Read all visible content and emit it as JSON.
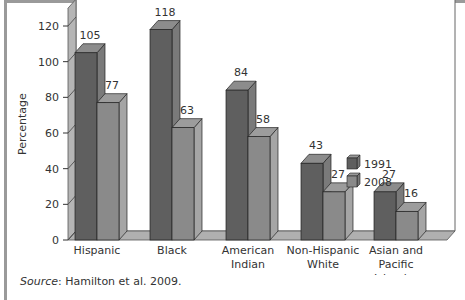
{
  "chart_data": {
    "type": "bar",
    "style": "3d-clustered",
    "title": "",
    "xlabel": "",
    "ylabel": "Percentage",
    "ylim": [
      0,
      130
    ],
    "yticks": [
      0,
      20,
      40,
      60,
      80,
      100,
      120
    ],
    "grid": false,
    "legend_position": "right-center",
    "categories": [
      "Hispanic",
      "Black",
      "American Indian",
      "Non-Hispanic White",
      "Asian and Pacific Islander"
    ],
    "category_lines": [
      [
        "Hispanic"
      ],
      [
        "Black"
      ],
      [
        "American",
        "Indian"
      ],
      [
        "Non-Hispanic",
        "White"
      ],
      [
        "Asian and",
        "Pacific",
        "Islander"
      ]
    ],
    "series": [
      {
        "name": "1991",
        "values": [
          105,
          118,
          84,
          43,
          27
        ],
        "color": "#5f5f5f"
      },
      {
        "name": "2008",
        "values": [
          77,
          63,
          58,
          27,
          16
        ],
        "color": "#8a8a8a"
      }
    ]
  },
  "source": {
    "label": "Source",
    "text": ": Hamilton et al. 2009."
  }
}
